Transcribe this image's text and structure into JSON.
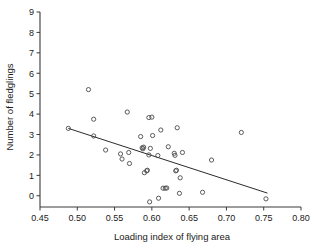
{
  "chart_data": {
    "type": "scatter",
    "title": "",
    "xlabel": "Loading index of flying area",
    "ylabel": "Number of fledglings",
    "xlim": [
      0.45,
      0.8
    ],
    "ylim": [
      -0.55,
      9.0
    ],
    "xticks": [
      0.45,
      0.5,
      0.55,
      0.6,
      0.65,
      0.7,
      0.75,
      0.8
    ],
    "xtick_labels": [
      "0.45",
      "0.50",
      "0.55",
      "0.60",
      "0.65",
      "0.70",
      "0.75",
      "0.80"
    ],
    "yticks": [
      0,
      1,
      2,
      3,
      4,
      5,
      6,
      7,
      8,
      9
    ],
    "ytick_labels": [
      "0",
      "1",
      "2",
      "3",
      "4",
      "5",
      "6",
      "7",
      "8",
      "9"
    ],
    "grid": false,
    "legend": null,
    "marker": "open-circle",
    "marker_color": "#4a4a4a",
    "points": [
      [
        0.488,
        3.3
      ],
      [
        0.515,
        5.2
      ],
      [
        0.522,
        3.75
      ],
      [
        0.522,
        2.93
      ],
      [
        0.538,
        2.24
      ],
      [
        0.558,
        2.05
      ],
      [
        0.56,
        1.8
      ],
      [
        0.567,
        4.1
      ],
      [
        0.569,
        2.12
      ],
      [
        0.57,
        1.58
      ],
      [
        0.585,
        2.9
      ],
      [
        0.587,
        2.35
      ],
      [
        0.588,
        2.3
      ],
      [
        0.589,
        2.38
      ],
      [
        0.59,
        1.13
      ],
      [
        0.593,
        1.22
      ],
      [
        0.594,
        1.25
      ],
      [
        0.596,
        3.83
      ],
      [
        0.596,
        2.0
      ],
      [
        0.597,
        -0.3
      ],
      [
        0.598,
        2.32
      ],
      [
        0.6,
        3.85
      ],
      [
        0.601,
        2.95
      ],
      [
        0.608,
        1.97
      ],
      [
        0.609,
        -0.12
      ],
      [
        0.612,
        3.22
      ],
      [
        0.615,
        0.37
      ],
      [
        0.618,
        0.37
      ],
      [
        0.62,
        0.38
      ],
      [
        0.622,
        2.4
      ],
      [
        0.63,
        2.08
      ],
      [
        0.631,
        1.98
      ],
      [
        0.632,
        1.22
      ],
      [
        0.633,
        1.25
      ],
      [
        0.634,
        3.33
      ],
      [
        0.637,
        0.12
      ],
      [
        0.638,
        0.88
      ],
      [
        0.641,
        2.12
      ],
      [
        0.668,
        0.17
      ],
      [
        0.68,
        1.75
      ],
      [
        0.72,
        3.1
      ],
      [
        0.753,
        -0.15
      ]
    ],
    "fit_line": {
      "type": "linear-regression",
      "x_start": 0.488,
      "y_start": 3.3,
      "x_end": 0.755,
      "y_end": 0.13
    }
  }
}
